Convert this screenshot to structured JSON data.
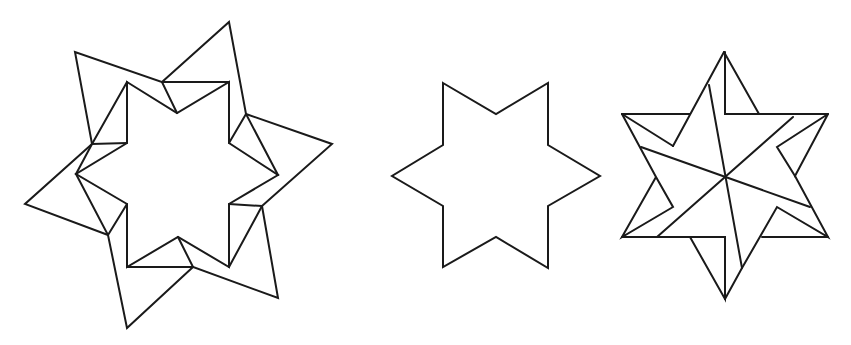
{
  "figures": [
    {
      "name": "folded-star-complex",
      "description": "six-pointed star with surrounding folded outer flaps"
    },
    {
      "name": "plain-six-pointed-star",
      "description": "simple six-pointed star outline"
    },
    {
      "name": "hexagram-with-internal-lines",
      "description": "six-pointed star divided by internal line segments"
    }
  ],
  "colors": {
    "stroke": "#1a1a1a",
    "background": "#ffffff"
  }
}
